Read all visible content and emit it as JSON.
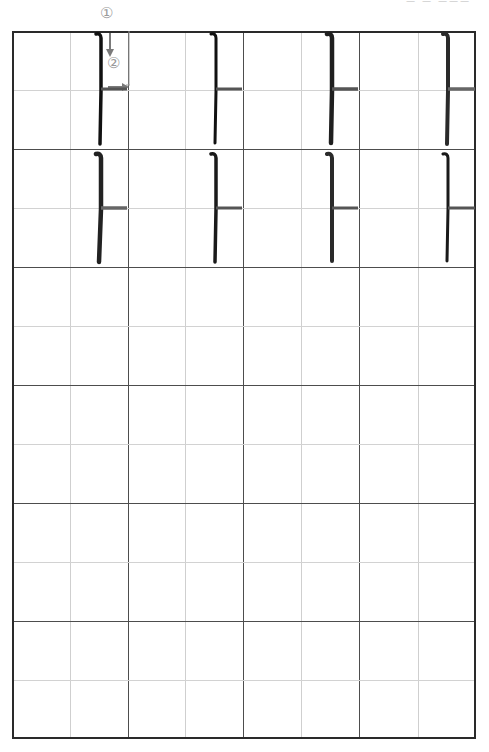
{
  "page": {
    "header_text": "ㅡ ㅡ ㅡㅡㅡ",
    "step_labels": [
      "①",
      "②"
    ]
  },
  "grid": {
    "columns": 4,
    "rows": 6,
    "cell_width_px": 116,
    "cell_height_px": 118
  },
  "practice": {
    "glyph": "ㅏ",
    "model_rows": [
      {
        "row": 1,
        "cells": [
          "ㅏ",
          "ㅏ",
          "ㅏ",
          "ㅏ"
        ]
      },
      {
        "row": 2,
        "cells": [
          "ㅏ",
          "ㅏ",
          "ㅏ",
          "ㅏ"
        ]
      }
    ],
    "empty_rows": 4
  },
  "colors": {
    "border": "#2a2a2a",
    "major_line": "#4d4d4d",
    "minor_line": "#cfcfcf",
    "ink": "#1a1a1a",
    "guide": "#8a8a8a"
  }
}
